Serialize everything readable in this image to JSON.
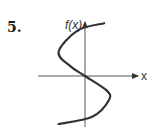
{
  "problem_number": "5.",
  "chart_data": {
    "type": "line",
    "title": "",
    "xlabel": "x",
    "ylabel": "f(x)",
    "grid": false,
    "series": [
      {
        "name": "curve",
        "points": [
          [
            0.8,
            2.2
          ],
          [
            -0.3,
            1.9
          ],
          [
            -1.1,
            1.0
          ],
          [
            -0.6,
            0.4
          ],
          [
            0,
            0
          ],
          [
            0.9,
            -0.6
          ],
          [
            1.0,
            -1.0
          ],
          [
            0.3,
            -1.7
          ],
          [
            -1.1,
            -2.0
          ]
        ]
      }
    ],
    "xlim": [
      -2,
      2.4
    ],
    "ylim": [
      -2.3,
      2.4
    ]
  }
}
